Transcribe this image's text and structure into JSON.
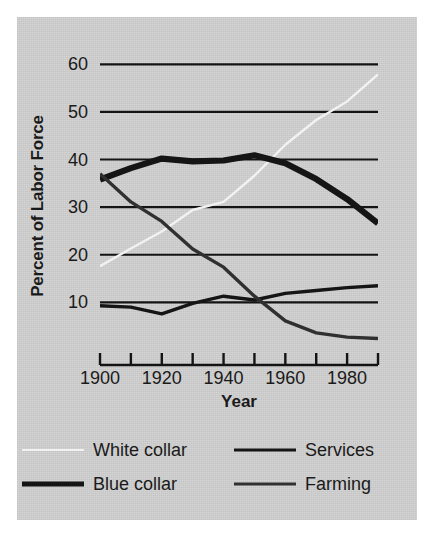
{
  "chart_data": {
    "type": "line",
    "title": "",
    "xlabel": "Year",
    "ylabel": "Percent of Labor Force",
    "xlim": [
      1900,
      1990
    ],
    "ylim": [
      0,
      63
    ],
    "grid": true,
    "grid_axis": "y",
    "legend_position": "below",
    "y_ticks": [
      "60",
      "50",
      "40",
      "30",
      "20",
      "10"
    ],
    "y_tick_values": [
      60,
      50,
      40,
      30,
      20,
      10
    ],
    "x_ticks": [
      "1900",
      "1920",
      "1940",
      "1960",
      "1980"
    ],
    "x_tick_values": [
      1900,
      1920,
      1940,
      1960,
      1980
    ],
    "x_minor_tick_values": [
      1910,
      1930,
      1950,
      1970,
      1990
    ],
    "x": [
      1900,
      1910,
      1920,
      1930,
      1940,
      1950,
      1960,
      1970,
      1980,
      1990
    ],
    "series": [
      {
        "name": "White collar",
        "color": "#f2f2f2",
        "width": 2.4,
        "values": [
          17.6,
          21.3,
          24.9,
          29.4,
          31.1,
          36.6,
          43.1,
          48.3,
          52.2,
          57.9
        ]
      },
      {
        "name": "Blue collar",
        "color": "#151515",
        "width": 6.2,
        "values": [
          35.8,
          38.2,
          40.2,
          39.6,
          39.8,
          40.9,
          39.2,
          35.9,
          31.7,
          26.6
        ]
      },
      {
        "name": "Services",
        "color": "#151515",
        "width": 3.4,
        "values": [
          9.3,
          9.0,
          7.6,
          9.8,
          11.3,
          10.5,
          11.9,
          12.5,
          13.1,
          13.5
        ]
      },
      {
        "name": "Farming",
        "color": "#303030",
        "width": 3.4,
        "values": [
          37.0,
          31.1,
          27.0,
          21.2,
          17.4,
          11.3,
          6.1,
          3.6,
          2.7,
          2.4
        ]
      }
    ]
  },
  "axes": {
    "ylabel": "Percent of Labor Force",
    "xlabel": "Year",
    "y_ticks": [
      "60",
      "50",
      "40",
      "30",
      "20",
      "10"
    ],
    "x_ticks": [
      "1900",
      "1920",
      "1940",
      "1960",
      "1980"
    ]
  },
  "legend": {
    "items": [
      {
        "label": "White collar",
        "color": "#f2f2f2",
        "thickness": "2px"
      },
      {
        "label": "Services",
        "color": "#151515",
        "thickness": "3px"
      },
      {
        "label": "Blue collar",
        "color": "#151515",
        "thickness": "5px"
      },
      {
        "label": "Farming",
        "color": "#303030",
        "thickness": "3px"
      }
    ]
  },
  "colors": {
    "page_background": "#ffffff",
    "panel_background": "#d2d2d2",
    "ink": "#1a1a1a",
    "gridline": "#141414"
  }
}
